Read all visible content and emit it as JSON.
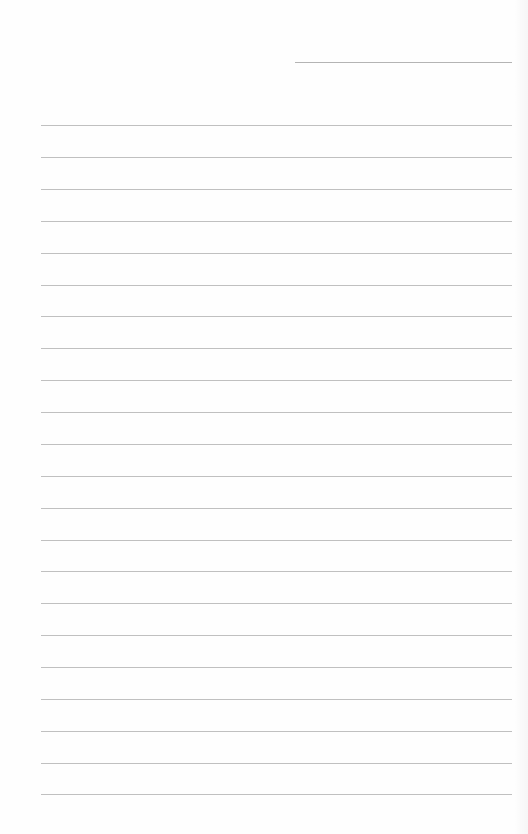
{
  "page": {
    "type": "lined-notebook-page",
    "background_color": "#fefefe",
    "line_color": "#c0c0c0",
    "date_line": {
      "present": true
    },
    "ruled_line_count": 22,
    "ruled_line_y": [
      125,
      157,
      189,
      221,
      253,
      285,
      316,
      348,
      380,
      412,
      444,
      476,
      508,
      540,
      571,
      603,
      635,
      667,
      699,
      731,
      763,
      794
    ],
    "text_content": ""
  }
}
